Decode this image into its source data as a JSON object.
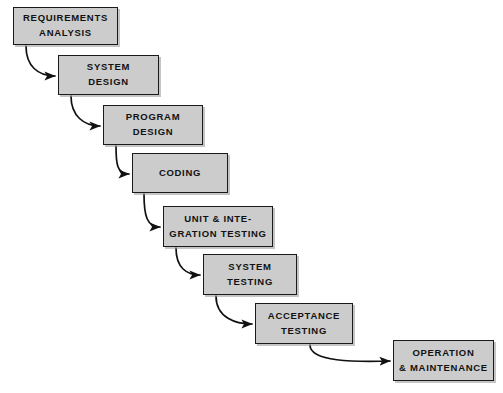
{
  "diagram": {
    "type": "waterfall-model-flowchart",
    "canvas": {
      "width": 503,
      "height": 393
    },
    "style": {
      "background_color": "#ffffff",
      "box_fill_color": "#cccccc",
      "box_border_color": "#1a1a1a",
      "text_color": "#121212",
      "arrow_color": "#111111"
    },
    "nodes": [
      {
        "id": "requirements-analysis",
        "lines": [
          "REQUIREMENTS",
          "ANALYSIS"
        ],
        "x": 13,
        "y": 7,
        "w": 105,
        "h": 38
      },
      {
        "id": "system-design",
        "lines": [
          "SYSTEM",
          "DESIGN"
        ],
        "x": 58,
        "y": 55,
        "w": 101,
        "h": 40
      },
      {
        "id": "program-design",
        "lines": [
          "PROGRAM",
          "DESIGN"
        ],
        "x": 103,
        "y": 105,
        "w": 100,
        "h": 40
      },
      {
        "id": "coding",
        "lines": [
          "CODING"
        ],
        "x": 132,
        "y": 153,
        "w": 96,
        "h": 40
      },
      {
        "id": "unit-and-integration-testing",
        "lines": [
          "UNIT & INTE-",
          "GRATION TESTING"
        ],
        "x": 163,
        "y": 206,
        "w": 110,
        "h": 41
      },
      {
        "id": "system-testing",
        "lines": [
          "SYSTEM",
          "TESTING"
        ],
        "x": 203,
        "y": 254,
        "w": 94,
        "h": 41
      },
      {
        "id": "acceptance-testing",
        "lines": [
          "ACCEPTANCE",
          "TESTING"
        ],
        "x": 255,
        "y": 303,
        "w": 98,
        "h": 41
      },
      {
        "id": "operation-and-maintenance",
        "lines": [
          "OPERATION",
          "& MAINTENANCE"
        ],
        "x": 393,
        "y": 340,
        "w": 101,
        "h": 41
      }
    ],
    "edges": [
      {
        "id": "edge-requirements-to-system-design",
        "from": "requirements-analysis",
        "to": "system-design",
        "path": "M 26 46 C 26 66 38 76 55 76"
      },
      {
        "id": "edge-system-design-to-program-design",
        "from": "system-design",
        "to": "program-design",
        "path": "M 71 96 C 71 116 84 126 100 126"
      },
      {
        "id": "edge-program-design-to-coding",
        "from": "program-design",
        "to": "coding",
        "path": "M 116 146 C 116 164 117 174 129 174"
      },
      {
        "id": "edge-coding-to-unit-integration",
        "from": "coding",
        "to": "unit-and-integration-testing",
        "path": "M 144 194 C 144 216 147 227 160 227"
      },
      {
        "id": "edge-unit-integration-to-system-test",
        "from": "unit-and-integration-testing",
        "to": "system-testing",
        "path": "M 176 248 C 176 268 187 275 200 275"
      },
      {
        "id": "edge-system-test-to-acceptance-test",
        "from": "system-testing",
        "to": "acceptance-testing",
        "path": "M 216 296 C 216 318 236 324 252 324"
      },
      {
        "id": "edge-acceptance-test-to-operation",
        "from": "acceptance-testing",
        "to": "operation-and-maintenance",
        "path": "M 310 345 C 310 362 355 362 390 361"
      }
    ]
  }
}
